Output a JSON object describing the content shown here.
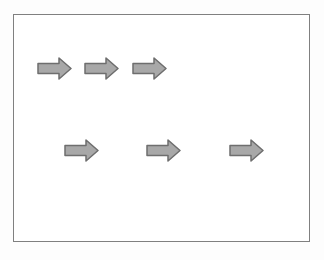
{
  "diagram": {
    "frame": {
      "border_color": "#808080",
      "fill": "#ffffff"
    },
    "arrow_style": {
      "shape": "right-block-arrow",
      "fill": "#a8a8a8",
      "stroke": "#6e6e6e",
      "stroke_width": 1.5,
      "width": 35,
      "height": 23
    },
    "rows": [
      {
        "label": "top-row",
        "y": 56,
        "arrow_xs": [
          36,
          83,
          131
        ]
      },
      {
        "label": "bottom-row",
        "y": 138,
        "arrow_xs": [
          63,
          145,
          228
        ]
      }
    ]
  }
}
